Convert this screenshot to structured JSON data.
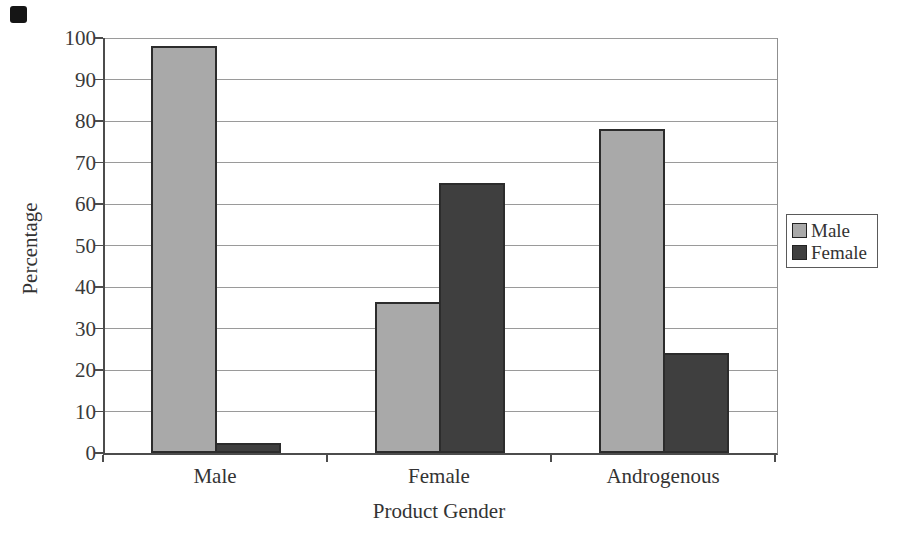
{
  "chart_data": {
    "type": "bar",
    "title": "",
    "categories": [
      "Male",
      "Female",
      "Androgenous"
    ],
    "series": [
      {
        "name": "Male",
        "color": "#a9a9a9",
        "values": [
          98,
          36.5,
          78
        ]
      },
      {
        "name": "Female",
        "color": "#3f3f3f",
        "values": [
          2.5,
          65,
          24
        ]
      }
    ],
    "xlabel": "Product Gender",
    "ylabel": "Percentage",
    "ylim": [
      0,
      100
    ],
    "ytick_step": 10,
    "yticks": [
      0,
      10,
      20,
      30,
      40,
      50,
      60,
      70,
      80,
      90,
      100
    ],
    "grid": true,
    "legend_position": "right",
    "colors": {
      "axis": "#4c4c4c",
      "grid": "#9a9a9a",
      "text": "#3a3a3a",
      "bar_border": "#2c2c2c",
      "legend_border": "#5a5a5a",
      "background": "#ffffff"
    }
  }
}
